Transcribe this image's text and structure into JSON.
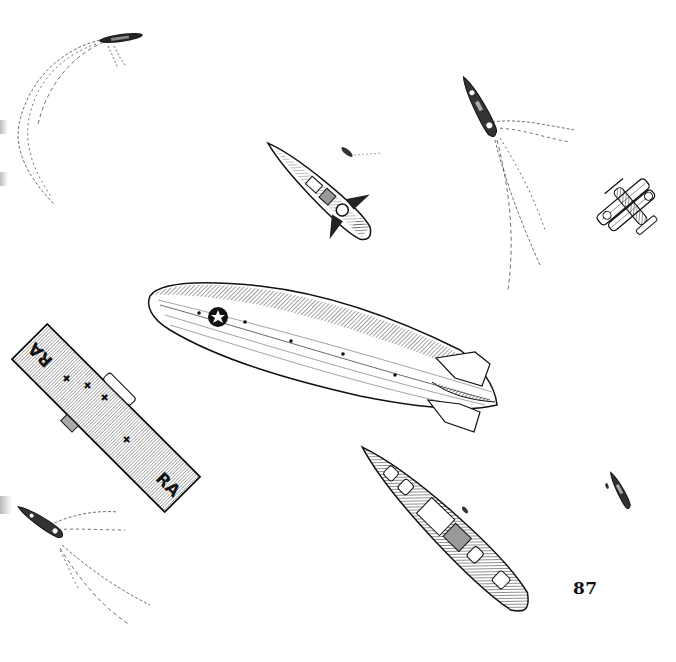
{
  "page": {
    "number": "87",
    "background": "#ffffff",
    "ink_color": "#1a1a1a"
  },
  "illustration": {
    "airship": {
      "label": "rigid airship",
      "insignia": "star-roundel"
    },
    "carrier": {
      "label": "aircraft carrier",
      "deck_markings": [
        "RA",
        "RA"
      ]
    },
    "biplane": {
      "label": "biplane",
      "insignia": "star-roundel"
    },
    "vessels": [
      {
        "label": "destroyer-top-left"
      },
      {
        "label": "submarine-center"
      },
      {
        "label": "destroyer-top-right"
      },
      {
        "label": "cruiser-bottom-center"
      },
      {
        "label": "destroyer-bottom-left"
      },
      {
        "label": "small-boat-right"
      }
    ]
  }
}
